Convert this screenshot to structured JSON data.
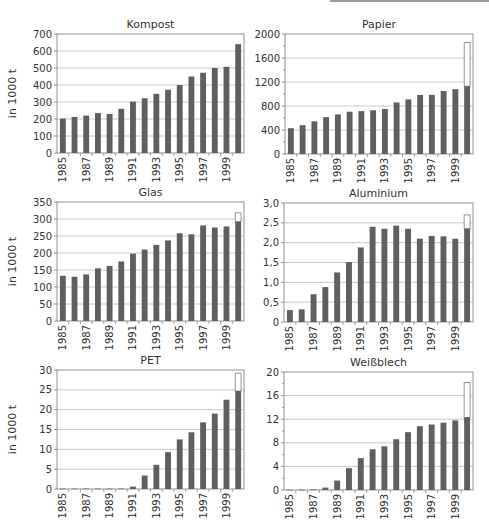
{
  "colors": {
    "bar": "#5f5f5f",
    "extension_fill": "#ffffff",
    "extension_stroke": "#7a7a7a",
    "grid": "#bdbdbd",
    "axis": "#888888",
    "text": "#333333"
  },
  "ylabel": "in 1000 t",
  "chart_data": [
    {
      "type": "bar",
      "title": "Kompost",
      "ylabel": "in 1000 t",
      "categories": [
        "1985",
        "1986",
        "1987",
        "1988",
        "1989",
        "1990",
        "1991",
        "1992",
        "1993",
        "1994",
        "1995",
        "1996",
        "1997",
        "1998",
        "1999",
        "2000"
      ],
      "xtick_labels": [
        "1985",
        "1987",
        "1989",
        "1991",
        "1993",
        "1995",
        "1997",
        "1999"
      ],
      "values": [
        203,
        212,
        220,
        235,
        230,
        260,
        302,
        322,
        348,
        372,
        400,
        450,
        472,
        500,
        507,
        640
      ],
      "extension_2000": null,
      "ylim": [
        0,
        700
      ],
      "yticks": [
        0,
        100,
        200,
        300,
        400,
        500,
        600,
        700
      ],
      "ytick_labels": [
        "0",
        "100",
        "200",
        "300",
        "400",
        "500",
        "600",
        "700"
      ],
      "minor_step": null,
      "grid": true,
      "frame": {
        "x": 57,
        "y": 34,
        "w": 187,
        "h": 119
      }
    },
    {
      "type": "bar",
      "title": "Papier",
      "ylabel": "",
      "categories": [
        "1985",
        "1986",
        "1987",
        "1988",
        "1989",
        "1990",
        "1991",
        "1992",
        "1993",
        "1994",
        "1995",
        "1996",
        "1997",
        "1998",
        "1999",
        "2000"
      ],
      "xtick_labels": [
        "1985",
        "1987",
        "1989",
        "1991",
        "1993",
        "1995",
        "1997",
        "1999"
      ],
      "values": [
        430,
        480,
        545,
        615,
        660,
        705,
        715,
        730,
        750,
        860,
        910,
        985,
        985,
        1050,
        1080,
        1130
      ],
      "extension_2000": 1860,
      "ylim": [
        0,
        2000
      ],
      "yticks": [
        0,
        400,
        800,
        1200,
        1600,
        2000
      ],
      "ytick_labels": [
        "0",
        "400",
        "800",
        "1200",
        "1600",
        "2000"
      ],
      "minor_step": 200,
      "grid": true,
      "frame": {
        "x": 285,
        "y": 34,
        "w": 188,
        "h": 120
      }
    },
    {
      "type": "bar",
      "title": "Glas",
      "ylabel": "in 1000 t",
      "categories": [
        "1985",
        "1986",
        "1987",
        "1988",
        "1989",
        "1990",
        "1991",
        "1992",
        "1993",
        "1994",
        "1995",
        "1996",
        "1997",
        "1998",
        "1999",
        "2000"
      ],
      "xtick_labels": [
        "1985",
        "1987",
        "1989",
        "1991",
        "1993",
        "1995",
        "1997",
        "1999"
      ],
      "values": [
        133,
        130,
        137,
        155,
        162,
        175,
        198,
        210,
        224,
        237,
        258,
        255,
        281,
        275,
        278,
        292
      ],
      "extension_2000": 318,
      "ylim": [
        0,
        350
      ],
      "yticks": [
        0,
        50,
        100,
        150,
        200,
        250,
        300,
        350
      ],
      "ytick_labels": [
        "0",
        "50",
        "100",
        "150",
        "200",
        "250",
        "300",
        "350"
      ],
      "minor_step": null,
      "grid": true,
      "frame": {
        "x": 57,
        "y": 202,
        "w": 187,
        "h": 119
      }
    },
    {
      "type": "bar",
      "title": "Aluminium",
      "ylabel": "",
      "categories": [
        "1985",
        "1986",
        "1987",
        "1988",
        "1989",
        "1990",
        "1991",
        "1992",
        "1993",
        "1994",
        "1995",
        "1996",
        "1997",
        "1998",
        "1999",
        "2000"
      ],
      "xtick_labels": [
        "1985",
        "1987",
        "1989",
        "1991",
        "1993",
        "1995",
        "1997",
        "1999"
      ],
      "values": [
        0.3,
        0.32,
        0.7,
        0.88,
        1.25,
        1.51,
        1.88,
        2.4,
        2.35,
        2.43,
        2.35,
        2.1,
        2.17,
        2.16,
        2.1,
        2.35
      ],
      "extension_2000": 2.7,
      "ylim": [
        0,
        3.0
      ],
      "yticks": [
        0,
        0.5,
        1.0,
        1.5,
        2.0,
        2.5,
        3.0
      ],
      "ytick_labels": [
        "0",
        "0,5",
        "1,0",
        "1,5",
        "2,0",
        "2,5",
        "3,0"
      ],
      "minor_step": null,
      "grid": true,
      "frame": {
        "x": 284,
        "y": 203,
        "w": 189,
        "h": 119
      }
    },
    {
      "type": "bar",
      "title": "PET",
      "ylabel": "in 1000 t",
      "categories": [
        "1985",
        "1986",
        "1987",
        "1988",
        "1989",
        "1990",
        "1991",
        "1992",
        "1993",
        "1994",
        "1995",
        "1996",
        "1997",
        "1998",
        "1999",
        "2000"
      ],
      "xtick_labels": [
        "1985",
        "1987",
        "1989",
        "1991",
        "1993",
        "1995",
        "1997",
        "1999"
      ],
      "values": [
        0.1,
        0.1,
        0.1,
        0.1,
        0.1,
        0.1,
        0.6,
        3.4,
        6.1,
        9.3,
        12.5,
        14.3,
        16.8,
        19.0,
        22.5,
        24.7
      ],
      "extension_2000": 29.2,
      "ylim": [
        0,
        30
      ],
      "yticks": [
        0,
        5,
        10,
        15,
        20,
        25,
        30
      ],
      "ytick_labels": [
        "0",
        "5",
        "10",
        "15",
        "20",
        "25",
        "30"
      ],
      "minor_step": null,
      "grid": true,
      "frame": {
        "x": 57,
        "y": 370,
        "w": 187,
        "h": 119
      }
    },
    {
      "type": "bar",
      "title": "Weißblech",
      "ylabel": "",
      "categories": [
        "1985",
        "1986",
        "1987",
        "1988",
        "1989",
        "1990",
        "1991",
        "1992",
        "1993",
        "1994",
        "1995",
        "1996",
        "1997",
        "1998",
        "1999",
        "2000"
      ],
      "xtick_labels": [
        "1985",
        "1987",
        "1989",
        "1991",
        "1993",
        "1995",
        "1997",
        "1999"
      ],
      "values": [
        0.05,
        0.05,
        0.1,
        0.4,
        1.6,
        3.7,
        5.4,
        6.9,
        7.4,
        8.6,
        9.8,
        10.8,
        11.1,
        11.4,
        11.8,
        12.3
      ],
      "extension_2000": 18.2,
      "ylim": [
        0,
        20
      ],
      "yticks": [
        0,
        4,
        8,
        12,
        16,
        20
      ],
      "ytick_labels": [
        "0",
        "4",
        "8",
        "12",
        "16",
        "20"
      ],
      "minor_step": 2,
      "grid": true,
      "frame": {
        "x": 284,
        "y": 372,
        "w": 189,
        "h": 118
      }
    }
  ]
}
